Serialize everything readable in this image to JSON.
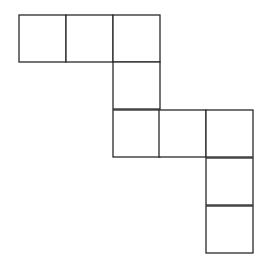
{
  "diagram": {
    "type": "polyomino-net",
    "stroke_color": "#2a2a2a",
    "fill_color": "#ffffff",
    "cell_size": 47,
    "squares": [
      {
        "x": 19,
        "y": 15
      },
      {
        "x": 66,
        "y": 15
      },
      {
        "x": 113,
        "y": 15
      },
      {
        "x": 113,
        "y": 62
      },
      {
        "x": 113,
        "y": 110
      },
      {
        "x": 159,
        "y": 110
      },
      {
        "x": 206,
        "y": 110
      },
      {
        "x": 206,
        "y": 158
      },
      {
        "x": 206,
        "y": 206
      }
    ]
  }
}
